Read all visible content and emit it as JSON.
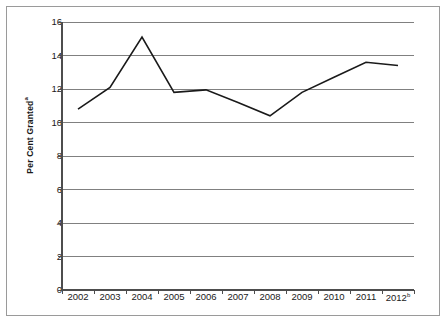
{
  "chart_data": {
    "type": "line",
    "title": "",
    "subtitle": "",
    "xlabel": "",
    "ylabel": "Per Cent Granted",
    "ylabel_superscript": "a",
    "categories": [
      "2002",
      "2003",
      "2004",
      "2005",
      "2006",
      "2007",
      "2008",
      "2009",
      "2010",
      "2011",
      "2012"
    ],
    "category_labels": [
      "2002",
      "2003",
      "2004",
      "2005",
      "2006",
      "2007",
      "2008",
      "2009",
      "2010",
      "2011",
      "2012"
    ],
    "last_category_superscript": "b",
    "series": [
      {
        "name": "Per Cent Granted",
        "color": "#1a1a1a",
        "values": [
          10.8,
          12.1,
          15.1,
          11.8,
          11.95,
          11.2,
          10.4,
          11.8,
          12.7,
          13.6,
          13.4
        ]
      }
    ],
    "ylim": [
      0,
      16
    ],
    "ytick_values": [
      0,
      2,
      4,
      6,
      8,
      10,
      12,
      14,
      16
    ],
    "ytick_labels": [
      "0",
      "2",
      "4",
      "6",
      "8",
      "10",
      "12",
      "14",
      "16"
    ],
    "grid": true,
    "grid_axis": "y",
    "grid_color": "#808080",
    "legend": false,
    "legend_position": "none",
    "axis_color": "#4d4d4d",
    "border_color": "#9a9a9a",
    "background_color": "#ffffff"
  },
  "axis_labels": {
    "y_title": "Per Cent Granted",
    "y_title_sup": "a"
  }
}
